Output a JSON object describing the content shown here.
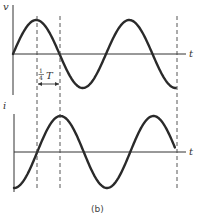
{
  "figure": {
    "caption": "(b)",
    "top_plot": {
      "y_label": "v",
      "x_label": "t",
      "curve": "sine",
      "description": "voltage v(t) = sin(ωt)",
      "cycles_shown": 1.75
    },
    "bottom_plot": {
      "y_label": "i",
      "x_label": "t",
      "curve": "negative cosine",
      "description": "current i(t) = -cos(ωt), lagging voltage by one quarter period",
      "cycles_shown": 2.0
    },
    "annotation": {
      "fraction_numerator": "1",
      "fraction_denominator": "4",
      "symbol": "T",
      "meaning": "phase difference of one quarter period"
    },
    "colors": {
      "curve": "#2a2a2a",
      "axis": "#333333"
    }
  }
}
